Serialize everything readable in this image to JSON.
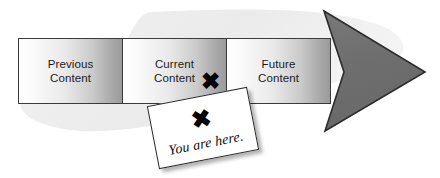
{
  "graphic": {
    "title": "You are here timeline arrow",
    "background_color": "#ffffff",
    "blob_color": "#ededed"
  },
  "timeline": {
    "segments": [
      {
        "id": "previous",
        "label": "Previous\nContent",
        "mark": ""
      },
      {
        "id": "current",
        "label": "Current\nContent",
        "mark": "✖"
      },
      {
        "id": "future",
        "label": "Future\nContent",
        "mark": ""
      }
    ],
    "border_color": "#3a3a3a",
    "gradient_start": "#fdfdfd",
    "gradient_end": "#9a9a9a"
  },
  "note": {
    "mark": "✖",
    "text": "You are here.",
    "background_color": "#ffffff",
    "border_color": "#2b2b2b"
  },
  "arrow": {
    "name": "right-pointing-dart-arrowhead",
    "fill_color": "#6e6e6e",
    "stroke_color": "#2c2c2c",
    "tip_label": ""
  }
}
